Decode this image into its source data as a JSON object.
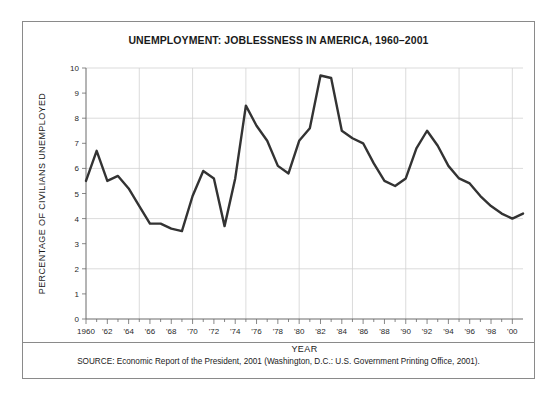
{
  "figure": {
    "title": "UNEMPLOYMENT: JOBLESSNESS IN AMERICA, 1960–2001",
    "source": "SOURCE: Economic Report of the President, 2001 (Washington, D.C.: U.S. Government Printing Office, 2001).",
    "border_color": "#8a8a8a",
    "background_color": "#ffffff"
  },
  "chart_data": {
    "type": "line",
    "title": "UNEMPLOYMENT: JOBLESSNESS IN AMERICA, 1960–2001",
    "xlabel": "YEAR",
    "ylabel": "PERCENTAGE OF CIVILIANS UNEMPLOYED",
    "xlim": [
      1960,
      2001
    ],
    "ylim": [
      0,
      10
    ],
    "grid": true,
    "legend": "none",
    "line_color": "#333333",
    "x_tick_labels": [
      "1960",
      "'62",
      "'64",
      "'66",
      "'68",
      "'70",
      "'72",
      "'74",
      "'76",
      "'78",
      "'80",
      "'82",
      "'84",
      "'86",
      "'88",
      "'90",
      "'92",
      "'94",
      "'96",
      "'98",
      "'00"
    ],
    "x_tick_values": [
      1960,
      1962,
      1964,
      1966,
      1968,
      1970,
      1972,
      1974,
      1976,
      1978,
      1980,
      1982,
      1984,
      1986,
      1988,
      1990,
      1992,
      1994,
      1996,
      1998,
      2000
    ],
    "y_tick_labels": [
      "0",
      "1",
      "2",
      "3",
      "4",
      "5",
      "6",
      "7",
      "8",
      "9",
      "10"
    ],
    "y_tick_values": [
      0,
      1,
      2,
      3,
      4,
      5,
      6,
      7,
      8,
      9,
      10
    ],
    "x_gridlines": [
      1965,
      1970,
      1975,
      1980,
      1985,
      1990,
      1995,
      2000
    ],
    "y_gridlines": [
      2,
      4,
      6,
      8,
      10
    ],
    "x": [
      1960,
      1961,
      1962,
      1963,
      1964,
      1965,
      1966,
      1967,
      1968,
      1969,
      1970,
      1971,
      1972,
      1973,
      1974,
      1975,
      1976,
      1977,
      1978,
      1979,
      1980,
      1981,
      1982,
      1983,
      1984,
      1985,
      1986,
      1987,
      1988,
      1989,
      1990,
      1991,
      1992,
      1993,
      1994,
      1995,
      1996,
      1997,
      1998,
      1999,
      2000,
      2001
    ],
    "values": [
      5.5,
      6.7,
      5.5,
      5.7,
      5.2,
      4.5,
      3.8,
      3.8,
      3.6,
      3.5,
      4.9,
      5.9,
      5.6,
      3.7,
      5.6,
      8.5,
      7.7,
      7.1,
      6.1,
      5.8,
      7.1,
      7.6,
      9.7,
      9.6,
      7.5,
      7.2,
      7.0,
      6.2,
      5.5,
      5.3,
      5.6,
      6.8,
      7.5,
      6.9,
      6.1,
      5.6,
      5.4,
      4.9,
      4.5,
      4.2,
      4.0,
      4.2
    ],
    "annotations": []
  }
}
